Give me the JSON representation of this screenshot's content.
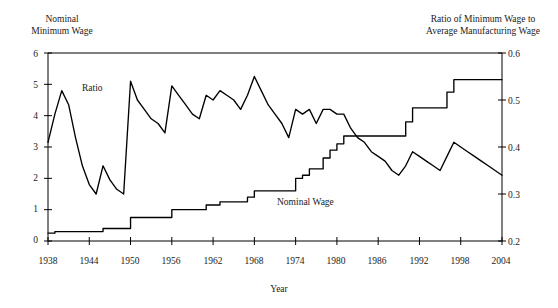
{
  "figure": {
    "background_color": "#ffffff",
    "line_color": "#000000",
    "partial_top_text": "  "
  },
  "labels": {
    "left_axis_title": "Nominal\nMinimum Wage",
    "right_axis_title": "Ratio of Minimum Wage to\nAverage Manufacturing Wage",
    "x_axis_title": "Year",
    "series_ratio": "Ratio",
    "series_nominal": "Nominal Wage"
  },
  "axes": {
    "left_ticks": [
      "6",
      "5",
      "4",
      "3",
      "2",
      "1",
      "0"
    ],
    "right_ticks": [
      "0.6",
      "0.5",
      "0.4",
      "0.3",
      "0.2"
    ],
    "x_ticks": [
      "1938",
      "1944",
      "1950",
      "1956",
      "1962",
      "1968",
      "1974",
      "1980",
      "1986",
      "1992",
      "1998",
      "2004"
    ]
  },
  "chart_data": {
    "type": "line",
    "title": "",
    "subtitle": "",
    "xlabel": "Year",
    "ylabel": "Nominal Minimum Wage",
    "y2label": "Ratio of Minimum Wage to Average Manufacturing Wage",
    "grid": false,
    "legend": "inline-annotations",
    "xlim": [
      1938,
      2004
    ],
    "ylim": [
      0,
      6
    ],
    "y2lim": [
      0.2,
      0.6
    ],
    "x": [
      1938,
      1939,
      1940,
      1941,
      1942,
      1943,
      1944,
      1945,
      1946,
      1947,
      1948,
      1949,
      1950,
      1951,
      1952,
      1953,
      1954,
      1955,
      1956,
      1957,
      1958,
      1959,
      1960,
      1961,
      1962,
      1963,
      1964,
      1965,
      1966,
      1967,
      1968,
      1969,
      1970,
      1971,
      1972,
      1973,
      1974,
      1975,
      1976,
      1977,
      1978,
      1979,
      1980,
      1981,
      1982,
      1983,
      1984,
      1985,
      1986,
      1987,
      1988,
      1989,
      1990,
      1991,
      1992,
      1993,
      1994,
      1995,
      1996,
      1997,
      1998,
      1999,
      2000,
      2001,
      2002,
      2003,
      2004
    ],
    "series": [
      {
        "name": "Nominal Wage",
        "axis": "left",
        "units": "dollars per hour",
        "values": [
          0.25,
          0.3,
          0.3,
          0.3,
          0.3,
          0.3,
          0.3,
          0.3,
          0.4,
          0.4,
          0.4,
          0.4,
          0.75,
          0.75,
          0.75,
          0.75,
          0.75,
          0.75,
          1.0,
          1.0,
          1.0,
          1.0,
          1.0,
          1.15,
          1.15,
          1.25,
          1.25,
          1.25,
          1.25,
          1.4,
          1.6,
          1.6,
          1.6,
          1.6,
          1.6,
          1.6,
          2.0,
          2.1,
          2.3,
          2.3,
          2.65,
          2.9,
          3.1,
          3.35,
          3.35,
          3.35,
          3.35,
          3.35,
          3.35,
          3.35,
          3.35,
          3.35,
          3.8,
          4.25,
          4.25,
          4.25,
          4.25,
          4.25,
          4.75,
          5.15,
          5.15,
          5.15,
          5.15,
          5.15,
          5.15,
          5.15,
          5.15
        ]
      },
      {
        "name": "Ratio",
        "axis": "right",
        "units": "ratio of minimum wage to average manufacturing wage",
        "values": [
          0.41,
          0.47,
          0.52,
          0.49,
          0.42,
          0.36,
          0.32,
          0.3,
          0.36,
          0.33,
          0.31,
          0.3,
          0.54,
          0.5,
          0.48,
          0.46,
          0.45,
          0.43,
          0.53,
          0.51,
          0.49,
          0.47,
          0.46,
          0.51,
          0.5,
          0.52,
          0.51,
          0.5,
          0.48,
          0.51,
          0.55,
          0.52,
          0.49,
          0.47,
          0.45,
          0.42,
          0.48,
          0.47,
          0.48,
          0.45,
          0.48,
          0.48,
          0.47,
          0.47,
          0.44,
          0.42,
          0.41,
          0.39,
          0.38,
          0.37,
          0.35,
          0.34,
          0.36,
          0.39,
          0.38,
          0.37,
          0.36,
          0.35,
          0.38,
          0.41,
          0.4,
          0.39,
          0.38,
          0.37,
          0.36,
          0.35,
          0.34
        ]
      }
    ]
  }
}
